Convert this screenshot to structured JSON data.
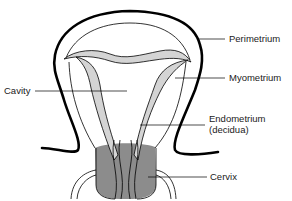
{
  "diagram": {
    "type": "anatomical-illustration",
    "labels": {
      "perimetrium": "Perimetrium",
      "myometrium": "Myometrium",
      "cavity": "Cavity",
      "endometrium_line1": "Endometrium",
      "endometrium_line2": "(decidua)",
      "cervix": "Cervix"
    },
    "colors": {
      "outline": "#000000",
      "endometrium_fill": "#d4d4d4",
      "cervix_fill": "#8c8c8c",
      "background": "#ffffff"
    }
  }
}
